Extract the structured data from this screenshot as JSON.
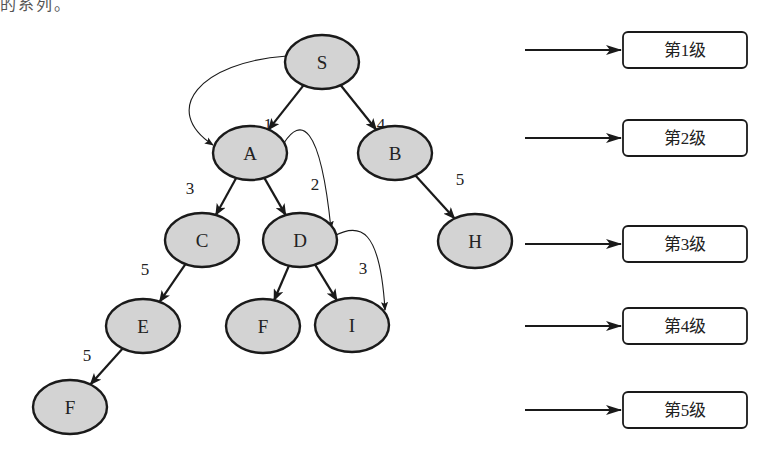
{
  "top_partial_text": "的系列。",
  "nodes": [
    {
      "id": "S",
      "label": "S",
      "cx": 322,
      "cy": 62
    },
    {
      "id": "A",
      "label": "A",
      "cx": 250,
      "cy": 153
    },
    {
      "id": "B",
      "label": "B",
      "cx": 395,
      "cy": 153
    },
    {
      "id": "C",
      "label": "C",
      "cx": 202,
      "cy": 240
    },
    {
      "id": "D",
      "label": "D",
      "cx": 300,
      "cy": 240
    },
    {
      "id": "H",
      "label": "H",
      "cx": 475,
      "cy": 241
    },
    {
      "id": "E",
      "label": "E",
      "cx": 143,
      "cy": 326
    },
    {
      "id": "F1",
      "label": "F",
      "cx": 263,
      "cy": 326
    },
    {
      "id": "I",
      "label": "I",
      "cx": 352,
      "cy": 325
    },
    {
      "id": "F2",
      "label": "F",
      "cx": 70,
      "cy": 407
    }
  ],
  "edges": [
    {
      "from": "S",
      "to": "A",
      "weight": "1",
      "label_x": 268,
      "label_y": 130
    },
    {
      "from": "S",
      "to": "B",
      "weight": "4",
      "label_x": 381,
      "label_y": 130
    },
    {
      "from": "A",
      "to": "C",
      "weight": "3",
      "label_x": 190,
      "label_y": 194
    },
    {
      "from": "A",
      "to": "D",
      "weight": "2",
      "label_x": 315,
      "label_y": 190
    },
    {
      "from": "B",
      "to": "H",
      "weight": "5",
      "label_x": 460,
      "label_y": 185
    },
    {
      "from": "C",
      "to": "E",
      "weight": "5",
      "label_x": 145,
      "label_y": 275
    },
    {
      "from": "D",
      "to": "F1",
      "weight": "",
      "label_x": 0,
      "label_y": 0
    },
    {
      "from": "D",
      "to": "I",
      "weight": "3",
      "label_x": 363,
      "label_y": 274
    },
    {
      "from": "E",
      "to": "F2",
      "weight": "5",
      "label_x": 87,
      "label_y": 361
    }
  ],
  "traversal_arcs": [
    {
      "from": "S",
      "to": "A",
      "path": "M 287 56 C 200 62, 160 110, 213 145"
    },
    {
      "from": "A",
      "to": "D",
      "path": "M 284 143 C 300 118, 320 120, 331 229"
    },
    {
      "from": "D",
      "to": "I",
      "path": "M 334 236 C 360 222, 380 228, 385 310"
    }
  ],
  "levels": [
    {
      "label": "第1级",
      "y": 50
    },
    {
      "label": "第2级",
      "y": 138
    },
    {
      "label": "第3级",
      "y": 244
    },
    {
      "label": "第4级",
      "y": 326
    },
    {
      "label": "第5级",
      "y": 410
    }
  ],
  "colors": {
    "node_fill": "#d3d3d3",
    "node_stroke": "#1a1a1a",
    "edge": "#1a1a1a",
    "box_fill": "#ffffff"
  }
}
